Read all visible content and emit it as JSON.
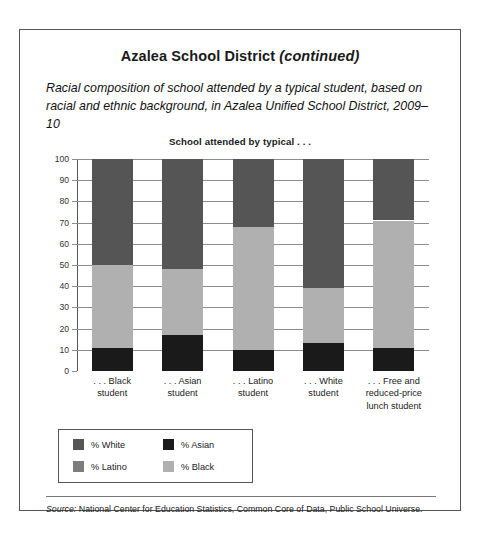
{
  "header": {
    "title_main": "Azalea School District",
    "title_continued": "(continued)",
    "subtitle": "Racial composition of school attended by a typical student, based on racial and ethnic background, in Azalea Unified School District, 2009–10"
  },
  "source": {
    "label": "Source:",
    "text": " National Center for Education Statistics, Common Core of Data, Public School Universe."
  },
  "colors": {
    "white_pct": "#555555",
    "latino_pct": "#7d7d7d",
    "asian_pct": "#1a1a1a",
    "black_pct": "#b0b0b0",
    "axis": "#555555",
    "grid": "#8c8c8c",
    "border": "#555555"
  },
  "chart_data": {
    "type": "bar",
    "stacked": true,
    "title": "School attended by typical . . .",
    "xlabel": "",
    "ylabel": "",
    "ylim": [
      0,
      100
    ],
    "yticks": [
      0,
      10,
      20,
      30,
      40,
      50,
      60,
      70,
      80,
      90,
      100
    ],
    "grid": true,
    "legend_position": "below-left",
    "categories": [
      ". . . Black student",
      ". . . Asian student",
      ". . . Latino student",
      ". . . White student",
      ". . . Free and reduced-price lunch student"
    ],
    "category_lines": [
      [
        ". . . Black",
        "student"
      ],
      [
        ". . . Asian",
        "student"
      ],
      [
        ". . . Latino",
        "student"
      ],
      [
        ". . . White",
        "student"
      ],
      [
        ". . . Free and",
        "reduced-price",
        "lunch student"
      ]
    ],
    "series": [
      {
        "name": "% Asian",
        "color": "#1a1a1a",
        "values": [
          11,
          17,
          10,
          13,
          11
        ]
      },
      {
        "name": "% Black",
        "color": "#b0b0b0",
        "values": [
          39,
          31,
          58,
          26,
          60
        ]
      },
      {
        "name": "% White",
        "color": "#555555",
        "values": [
          50,
          52,
          32,
          61,
          29
        ]
      }
    ],
    "stack_order_bottom_to_top": [
      "% Asian",
      "% Black",
      "% White"
    ],
    "cumulative_tops": [
      [
        11,
        50,
        100
      ],
      [
        17,
        48,
        100
      ],
      [
        10,
        68,
        100
      ],
      [
        13,
        39,
        100
      ],
      [
        11,
        71,
        100
      ]
    ]
  },
  "legend": {
    "items": [
      {
        "label": "% White",
        "color": "#555555"
      },
      {
        "label": "% Asian",
        "color": "#1a1a1a"
      },
      {
        "label": "% Latino",
        "color": "#7d7d7d"
      },
      {
        "label": "% Black",
        "color": "#b0b0b0"
      }
    ]
  }
}
